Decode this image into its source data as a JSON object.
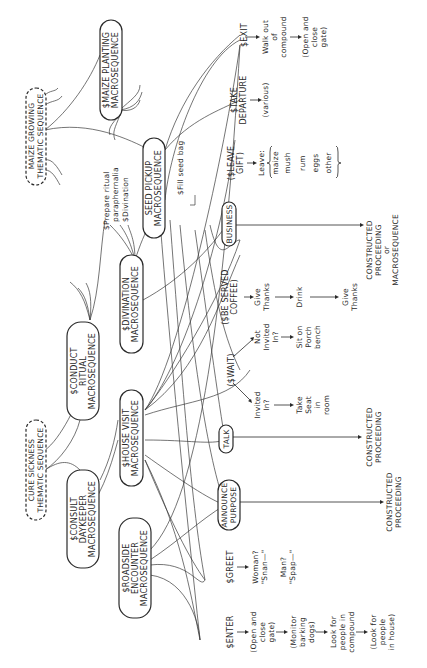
{
  "diagram": {
    "orientation": "rotated 90deg counter-clockwise",
    "thematic_sequences": [
      {
        "id": "maize_growing",
        "lines": [
          "MAIZE GROWING",
          "THEMATIC SEQUENCE"
        ],
        "style": "dashed"
      },
      {
        "id": "cure_sickness",
        "lines": [
          "CURE SICKNESS",
          "THEMATIC SEQUENCE"
        ],
        "style": "dashed"
      }
    ],
    "macrosequences": [
      {
        "id": "maize_planting",
        "lines": [
          "$MAIZE PLANTING",
          "MACROSEQUENCE"
        ]
      },
      {
        "id": "seed_pickup",
        "lines": [
          "SEED PICKUP",
          "MACROSEQUENCE"
        ]
      },
      {
        "id": "conduct_ritual",
        "lines": [
          "$CONDUCT",
          "RITUAL",
          "MACROSEQUENCE"
        ]
      },
      {
        "id": "divination",
        "lines": [
          "$DIVINATION",
          "MACROSEQUENCE"
        ]
      },
      {
        "id": "consult_daykeeper",
        "lines": [
          "$CONSULT",
          "DAYKEEPER",
          "MACROSEQUENCE"
        ]
      },
      {
        "id": "house_visit",
        "lines": [
          "$HOUSE VISIT",
          "MACROSEQUENCE"
        ]
      },
      {
        "id": "roadside_encounter",
        "lines": [
          "$ROADSIDE",
          "ENCOUNTER",
          "MACROSEQUENCE"
        ]
      }
    ],
    "annotations": {
      "prepare_ritual": [
        "$Prepare ritual",
        "paraphernalia"
      ],
      "divination_step": "$Divination",
      "fill_seed_bag": "$Fill seed bag"
    },
    "scenes": [
      {
        "id": "exit",
        "label": "$EXIT",
        "steps": [
          [
            "Walk out",
            "of",
            "compound"
          ],
          [
            "(Open and",
            "close",
            "gate)"
          ]
        ]
      },
      {
        "id": "take_departure",
        "label": [
          "$TAKE",
          "DEPARTURE"
        ],
        "steps": [
          [
            "(various)"
          ]
        ]
      },
      {
        "id": "leave_gift",
        "label": [
          "($LEAVE",
          "GIFT)"
        ],
        "steps": [
          [
            "Leave:"
          ]
        ],
        "items": [
          "maize",
          "mush",
          "rum",
          "eggs",
          "other"
        ]
      },
      {
        "id": "business",
        "label": "BUSINESS",
        "result": [
          "CONSTRUCTED",
          "PROCEEDING",
          "or",
          "MACROSEQUENCE"
        ]
      },
      {
        "id": "be_served_coffee",
        "label": [
          "($BE SERVED",
          "COFFEE)"
        ],
        "steps": [
          [
            "Give",
            "Thanks"
          ],
          [
            "Drink"
          ],
          [
            "Give",
            "Thanks"
          ]
        ]
      },
      {
        "id": "wait",
        "label": "($WAIT)",
        "branches": [
          {
            "cond": [
              "Not",
              "Invited",
              "In?"
            ],
            "step": [
              "Sit on",
              "Porch",
              "bench"
            ]
          },
          {
            "cond": [
              "Invited",
              "In?"
            ],
            "step": [
              "Take",
              "Seat",
              "in",
              "room"
            ]
          }
        ]
      },
      {
        "id": "talk",
        "label": "TALK",
        "result": [
          "CONSTRUCTED",
          "PROCEEDING"
        ]
      },
      {
        "id": "announce_purpose",
        "label": [
          "ANNOUNCE",
          "PURPOSE"
        ],
        "result": [
          "CONSTRUCTED",
          "PROCEEDING"
        ]
      },
      {
        "id": "greet",
        "label": "$GREET",
        "steps": [
          [
            "Woman?",
            "\"Snan—\""
          ],
          [
            "Man?",
            "\"Spap—\""
          ]
        ]
      },
      {
        "id": "enter",
        "label": "$ENTER",
        "steps": [
          [
            "(Open and",
            "close",
            "gate)"
          ],
          [
            "(Monitor",
            "barking",
            "dogs)"
          ],
          [
            "Look for",
            "people in",
            "compound"
          ],
          [
            "(Look for",
            "people",
            "in house)"
          ]
        ]
      }
    ]
  }
}
